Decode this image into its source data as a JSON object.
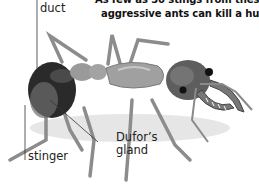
{
  "caption": {
    "line1": "As few as 30 stings from these",
    "line2": "aggressive ants can kill a human"
  },
  "labels": {
    "duct": "duct",
    "stinger": "stinger",
    "dufors_gland_line1": "Dufor’s",
    "dufors_gland_line2": "gland"
  },
  "illustration": {
    "subject": "bulldog ant",
    "colors": {
      "body": "#8a8a8a",
      "abdomen": "#2a2a2a",
      "head": "#555555",
      "leader_line": "#333333"
    }
  }
}
